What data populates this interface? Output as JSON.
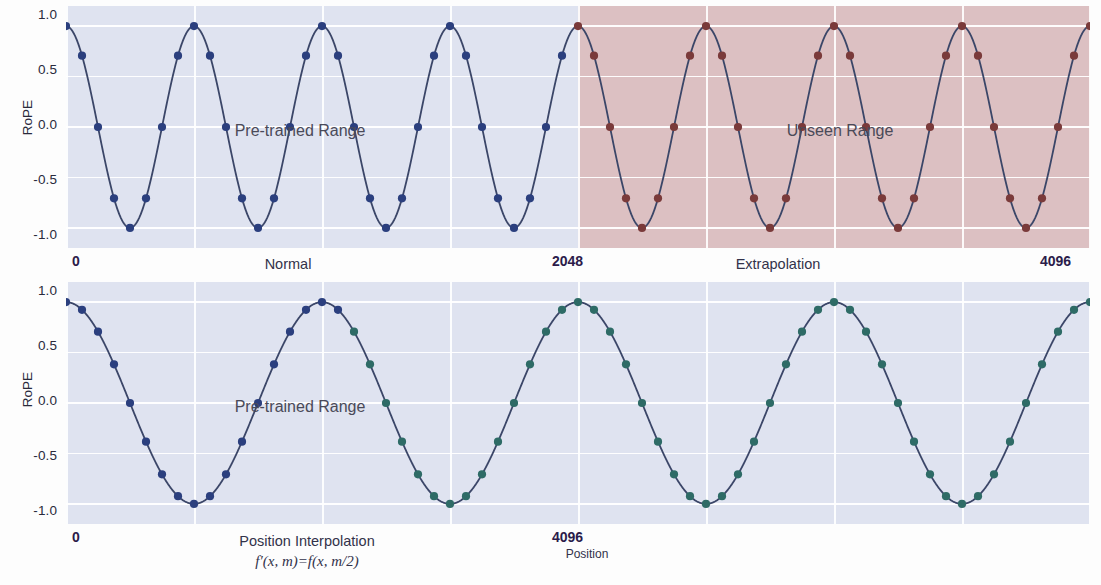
{
  "figure": {
    "width": 1101,
    "height": 585,
    "background": "#fdfdfd"
  },
  "colors": {
    "pretrained_band": "#dfe3f0",
    "unseen_band": "#dcc0c2",
    "line": "#3b4668",
    "dot_normal": "#2b3f7e",
    "dot_unseen": "#7a3a3a",
    "dot_interp": "#2e6b66",
    "grid": "#ffffff",
    "tick_text": "#2a2a3c",
    "xtick_text": "#2b1b4a",
    "annotation_text": "#4a4a58"
  },
  "panels": [
    {
      "id": "top",
      "ylabel": "RoPE",
      "yticks": [
        "1.0",
        "0.5",
        "0.0",
        "-0.5",
        "-1.0"
      ],
      "ytick_values": [
        1.0,
        0.5,
        0.0,
        -0.5,
        -1.0
      ],
      "ylim": [
        -1.12,
        1.12
      ],
      "xlim": [
        0,
        4096
      ],
      "xticks": [
        {
          "label": "0",
          "value": 0
        },
        {
          "label": "2048",
          "value": 2048
        },
        {
          "label": "4096",
          "value": 4096
        }
      ],
      "bands": [
        {
          "name": "pretrained",
          "from": 0,
          "to": 2048,
          "color": "#dfe3f0",
          "annotation": "Pre-trained Range"
        },
        {
          "name": "unseen",
          "from": 2048,
          "to": 4096,
          "color": "#dcc0c2",
          "annotation": "Unseen Range"
        }
      ],
      "captions": [
        {
          "text": "Normal",
          "at": 1024
        },
        {
          "text": "Extrapolation",
          "at": 3072
        }
      ]
    },
    {
      "id": "bottom",
      "ylabel": "RoPE",
      "yticks": [
        "1.0",
        "0.5",
        "0.0",
        "-0.5",
        "-1.0"
      ],
      "ytick_values": [
        1.0,
        0.5,
        0.0,
        -0.5,
        -1.0
      ],
      "ylim": [
        -1.12,
        1.12
      ],
      "xlim": [
        0,
        4096
      ],
      "xticks": [
        {
          "label": "0",
          "value": 0
        },
        {
          "label": "4096",
          "value": 4096
        }
      ],
      "bands": [
        {
          "name": "pretrained",
          "from": 0,
          "to": 4096,
          "color": "#dfe3f0",
          "annotation": "Pre-trained Range"
        }
      ],
      "captions": [
        {
          "text": "Position Interpolation",
          "at": 2048
        }
      ],
      "formula": "f′(x, m)=f(x, m/2)",
      "axis_title": "Position"
    }
  ],
  "chart_data": {
    "type": "line",
    "title": "",
    "xlabel": "Position",
    "ylabel": "RoPE",
    "xlim": [
      0,
      4096
    ],
    "ylim": [
      -1.12,
      1.12
    ],
    "grid": true,
    "legend": "none",
    "subplots": [
      {
        "name": "Normal / Extrapolation",
        "description": "RoPE value f(x, m) = cos(2*pi*m/512) sampled every 64 positions from 0 to 4096. Blue markers are within the pre-trained range (0-2048); dark-red markers are in the unseen/extrapolated range (2048-4096).",
        "function": "cos(2*pi*m/512)",
        "period": 512,
        "sample_step": 64,
        "x": [
          0,
          64,
          128,
          192,
          256,
          320,
          384,
          448,
          512,
          576,
          640,
          704,
          768,
          832,
          896,
          960,
          1024,
          1088,
          1152,
          1216,
          1280,
          1344,
          1408,
          1472,
          1536,
          1600,
          1664,
          1728,
          1792,
          1856,
          1920,
          1984,
          2048,
          2112,
          2176,
          2240,
          2304,
          2368,
          2432,
          2496,
          2560,
          2624,
          2688,
          2752,
          2816,
          2880,
          2944,
          3008,
          3072,
          3136,
          3200,
          3264,
          3328,
          3392,
          3456,
          3520,
          3584,
          3648,
          3712,
          3776,
          3840,
          3904,
          3968,
          4032,
          4096
        ],
        "y": [
          1.0,
          0.707,
          0.0,
          -0.707,
          -1.0,
          -0.707,
          0.0,
          0.707,
          1.0,
          0.707,
          0.0,
          -0.707,
          -1.0,
          -0.707,
          0.0,
          0.707,
          1.0,
          0.707,
          0.0,
          -0.707,
          -1.0,
          -0.707,
          0.0,
          0.707,
          1.0,
          0.707,
          0.0,
          -0.707,
          -1.0,
          -0.707,
          0.0,
          0.707,
          1.0,
          0.707,
          0.0,
          -0.707,
          -1.0,
          -0.707,
          0.0,
          0.707,
          1.0,
          0.707,
          0.0,
          -0.707,
          -1.0,
          -0.707,
          0.0,
          0.707,
          1.0,
          0.707,
          0.0,
          -0.707,
          -1.0,
          -0.707,
          0.0,
          0.707,
          1.0,
          0.707,
          0.0,
          -0.707,
          -1.0,
          -0.707,
          0.0,
          0.707,
          1.0
        ],
        "marker_split_at": 2048,
        "marker_colors": [
          "#2b3f7e",
          "#7a3a3a"
        ]
      },
      {
        "name": "Position Interpolation",
        "description": "RoPE value f'(x, m) = f(x, m/2) = cos(2*pi*m/1024) sampled every 64 positions from 0 to 4096, so the wave has half the frequency and fits 4 periods in 0-4096 while all positions stay inside the pre-trained range. Markers shift from blue to teal across the sweep.",
        "function": "cos(2*pi*m/1024)",
        "period": 1024,
        "sample_step": 64,
        "x": [
          0,
          64,
          128,
          192,
          256,
          320,
          384,
          448,
          512,
          576,
          640,
          704,
          768,
          832,
          896,
          960,
          1024,
          1088,
          1152,
          1216,
          1280,
          1344,
          1408,
          1472,
          1536,
          1600,
          1664,
          1728,
          1792,
          1856,
          1920,
          1984,
          2048,
          2112,
          2176,
          2240,
          2304,
          2368,
          2432,
          2496,
          2560,
          2624,
          2688,
          2752,
          2816,
          2880,
          2944,
          3008,
          3072,
          3136,
          3200,
          3264,
          3328,
          3392,
          3456,
          3520,
          3584,
          3648,
          3712,
          3776,
          3840,
          3904,
          3968,
          4032,
          4096
        ],
        "y": [
          1.0,
          0.924,
          0.707,
          0.383,
          0.0,
          -0.383,
          -0.707,
          -0.924,
          -1.0,
          -0.924,
          -0.707,
          -0.383,
          0.0,
          0.383,
          0.707,
          0.924,
          1.0,
          0.924,
          0.707,
          0.383,
          0.0,
          -0.383,
          -0.707,
          -0.924,
          -1.0,
          -0.924,
          -0.707,
          -0.383,
          0.0,
          0.383,
          0.707,
          0.924,
          1.0,
          0.924,
          0.707,
          0.383,
          0.0,
          -0.383,
          -0.707,
          -0.924,
          -1.0,
          -0.924,
          -0.707,
          -0.383,
          0.0,
          0.383,
          0.707,
          0.924,
          1.0,
          0.924,
          0.707,
          0.383,
          0.0,
          -0.383,
          -0.707,
          -0.924,
          -1.0,
          -0.924,
          -0.707,
          -0.383,
          0.0,
          0.383,
          0.707,
          0.924,
          1.0
        ],
        "marker_split_at": 1100,
        "marker_colors": [
          "#2b3f7e",
          "#2e6b66"
        ]
      }
    ]
  }
}
